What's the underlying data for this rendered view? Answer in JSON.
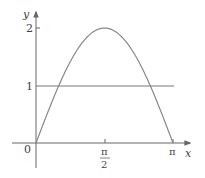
{
  "chart_data": {
    "type": "line",
    "title": "",
    "xlabel": "x",
    "ylabel": "y",
    "x_ticks": [
      "0",
      "π/2",
      "π"
    ],
    "y_ticks": [
      "1",
      "2"
    ],
    "xlim": [
      0,
      3.1416
    ],
    "ylim": [
      0,
      2
    ],
    "grid": false,
    "legend": null,
    "series": [
      {
        "name": "y = 2 sin x",
        "x": [
          0,
          0.3927,
          0.7854,
          1.1781,
          1.5708,
          1.9635,
          2.3562,
          2.7489,
          3.1416
        ],
        "values": [
          0,
          0.765,
          1.414,
          1.848,
          2,
          1.848,
          1.414,
          0.765,
          0
        ]
      },
      {
        "name": "y = 1",
        "x": [
          0,
          3.1416
        ],
        "values": [
          1,
          1
        ]
      }
    ]
  },
  "labels": {
    "origin": "0",
    "x_axis": "x",
    "y_axis": "y",
    "tick_pi_half_num": "π",
    "tick_pi_half_den": "2",
    "tick_pi": "π",
    "tick_y1": "1",
    "tick_y2": "2"
  },
  "colors": {
    "axis": "#555555",
    "curve": "#777777",
    "text": "#444444"
  }
}
